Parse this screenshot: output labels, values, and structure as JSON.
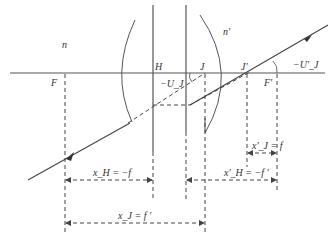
{
  "diagram": {
    "type": "optical-system-cardinal-points",
    "colors": {
      "line": "#444444",
      "text": "#333333",
      "background": "#ffffff"
    },
    "media": {
      "object_space": "n",
      "image_space": "n'"
    },
    "points": {
      "F": "F",
      "H": "H",
      "J": "J",
      "J_prime": "J'",
      "F_prime": "F'"
    },
    "angles": {
      "U_J": "−U_J",
      "U_J_prime": "−U'_J"
    },
    "dimensions": {
      "x_H": "x_H = −f",
      "x_J": "x_J = f '",
      "x_J_prime": "x'_J = f",
      "x_H_prime": "x'_H = −f '"
    }
  }
}
